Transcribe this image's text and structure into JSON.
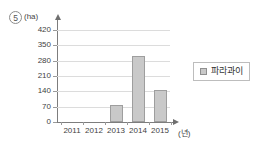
{
  "item": {
    "number": "5"
  },
  "legend": {
    "position": "right",
    "entries": [
      {
        "label": "파라과이",
        "swatch": "legend-swatch-icon",
        "color": "#c9c9c9"
      }
    ]
  },
  "axes": {
    "y_unit": "(ha)",
    "x_unit": "(년)"
  },
  "chart_data": {
    "type": "bar",
    "title": "",
    "xlabel": "년",
    "ylabel": "ha",
    "categories": [
      "2011",
      "2012",
      "2013",
      "2014",
      "2015"
    ],
    "series": [
      {
        "name": "파라과이",
        "values": [
          0,
          0,
          78,
          300,
          148
        ]
      }
    ],
    "yticks": [
      0,
      70,
      140,
      210,
      280,
      350,
      420
    ],
    "ylim": [
      0,
      440
    ],
    "grid": true,
    "legend_position": "right",
    "bar_color": "#c9c9c9",
    "bar_border_color": "#9e9e9e"
  }
}
